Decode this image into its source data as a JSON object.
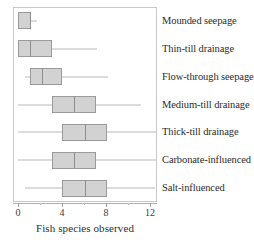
{
  "chart_data": {
    "type": "boxplot",
    "title": "",
    "xlabel": "Fish species observed",
    "ylabel": "",
    "xlim": [
      0,
      13.1
    ],
    "grid": false,
    "legend": null,
    "orientation": "horizontal",
    "xticks": [
      0,
      4,
      8,
      12
    ],
    "xtick_labels": [
      "0",
      "4",
      "8",
      "12"
    ],
    "xminor_ticks": [
      2,
      6,
      10
    ],
    "categories": [
      "Mounded seepage",
      "Thin-till drainage",
      "Flow-through seepage",
      "Medium-till drainage",
      "Thick-till drainage",
      "Carbonate-influenced",
      "Salt-influenced"
    ],
    "boxes": [
      {
        "category": "Mounded seepage",
        "whisker_low": 0.0,
        "q1": 0.0,
        "median": 1.1,
        "q3": 1.2,
        "whisker_high": 1.7
      },
      {
        "category": "Thin-till drainage",
        "whisker_low": 0.0,
        "q1": 0.0,
        "median": 1.1,
        "q3": 3.1,
        "whisker_high": 7.2
      },
      {
        "category": "Flow-through seepage",
        "whisker_low": 0.6,
        "q1": 1.1,
        "median": 2.2,
        "q3": 4.0,
        "whisker_high": 8.2
      },
      {
        "category": "Medium-till drainage",
        "whisker_low": 0.0,
        "q1": 3.1,
        "median": 5.1,
        "q3": 7.1,
        "whisker_high": 11.2
      },
      {
        "category": "Thick-till drainage",
        "whisker_low": 0.0,
        "q1": 4.0,
        "median": 6.1,
        "q3": 8.1,
        "whisker_high": 12.5
      },
      {
        "category": "Carbonate-influenced",
        "whisker_low": 0.0,
        "q1": 3.1,
        "median": 5.1,
        "q3": 7.1,
        "whisker_high": 12.5
      },
      {
        "category": "Salt-influenced",
        "whisker_low": 0.6,
        "q1": 4.0,
        "median": 6.1,
        "q3": 8.1,
        "whisker_high": 12.5
      }
    ],
    "colors": {
      "box_fill": "#d2d2d2",
      "box_border": "#9a9a9a",
      "median": "#8f8f8f",
      "whisker": "#b9b9b9",
      "frame": "#c8c8c8",
      "text": "#2b2b2b",
      "background": "#ffffff"
    }
  }
}
